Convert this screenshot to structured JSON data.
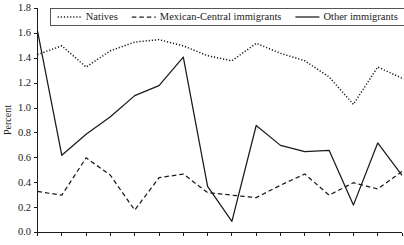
{
  "chart_data": {
    "type": "line",
    "title": "",
    "xlabel": "",
    "ylabel": "Percent",
    "ylim": [
      0.0,
      1.8
    ],
    "ytick_labels": [
      "0.0",
      "0.2",
      "0.4",
      "0.6",
      "0.8",
      "1.0",
      "1.2",
      "1.4",
      "1.6",
      "1.8"
    ],
    "ytick_values": [
      0.0,
      0.2,
      0.4,
      0.6,
      0.8,
      1.0,
      1.2,
      1.4,
      1.6,
      1.8
    ],
    "xtick_labels": [],
    "x_tick_count": 16,
    "grid": false,
    "legend_position": "top-center",
    "x": [
      1,
      2,
      3,
      4,
      5,
      6,
      7,
      8,
      9,
      10,
      11,
      12,
      13,
      14,
      15,
      16
    ],
    "series": [
      {
        "name": "Natives",
        "style": "dotted",
        "color": "#1a1a1a",
        "values": [
          1.43,
          1.5,
          1.33,
          1.46,
          1.53,
          1.55,
          1.5,
          1.42,
          1.38,
          1.52,
          1.44,
          1.38,
          1.25,
          1.03,
          1.33,
          1.24
        ]
      },
      {
        "name": "Mexican-Central immigrants",
        "style": "dashed",
        "color": "#1a1a1a",
        "values": [
          0.33,
          0.3,
          0.6,
          0.46,
          0.18,
          0.44,
          0.47,
          0.32,
          0.3,
          0.28,
          0.38,
          0.47,
          0.3,
          0.4,
          0.35,
          0.49
        ]
      },
      {
        "name": "Other immigrants",
        "style": "solid",
        "color": "#1a1a1a",
        "values": [
          1.62,
          0.62,
          0.79,
          0.93,
          1.1,
          1.18,
          1.41,
          0.37,
          0.09,
          0.86,
          0.7,
          0.65,
          0.66,
          0.22,
          0.72,
          0.46
        ]
      }
    ]
  },
  "axis": {
    "y_title": "Percent"
  },
  "legend": {
    "items": [
      {
        "label": "Natives",
        "style": "dotted"
      },
      {
        "label": "Mexican-Central immigrants",
        "style": "dashed"
      },
      {
        "label": "Other immigrants",
        "style": "solid"
      }
    ]
  }
}
